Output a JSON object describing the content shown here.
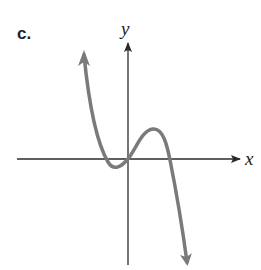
{
  "figure": {
    "part_label": "c.",
    "x_axis_label": "x",
    "y_axis_label": "y",
    "colors": {
      "axis": "#2a2a2a",
      "curve": "#7a7a7a",
      "background": "#ffffff"
    },
    "curve_description": "Cubic-like curve with negative leading coefficient: rises from upper-left arrow, local minimum just left of origin below x-axis, passes through origin, local maximum right of origin above x-axis, crosses x-axis and falls to lower-right arrow"
  }
}
